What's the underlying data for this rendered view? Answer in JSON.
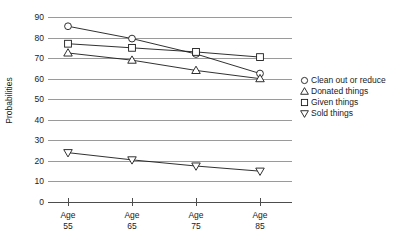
{
  "chart_data": {
    "type": "line",
    "title": "",
    "xlabel": "",
    "ylabel": "Probabilities",
    "categories": [
      "Age 55",
      "Age 65",
      "Age 75",
      "Age 85"
    ],
    "category_lines": [
      {
        "line1": "Age",
        "line2": "55"
      },
      {
        "line1": "Age",
        "line2": "65"
      },
      {
        "line1": "Age",
        "line2": "75"
      },
      {
        "line1": "Age",
        "line2": "85"
      }
    ],
    "ylim": [
      0,
      90
    ],
    "yticks": [
      0,
      10,
      20,
      30,
      40,
      50,
      60,
      70,
      80,
      90
    ],
    "ytick_labels": [
      "0",
      "10",
      "20",
      "30",
      "40",
      "50",
      "60",
      "70",
      "80",
      "90"
    ],
    "grid": true,
    "legend_position": "right",
    "series": [
      {
        "name": "Clean out or reduce",
        "marker": "circle",
        "values": [
          85.5,
          79.5,
          72.0,
          62.5
        ]
      },
      {
        "name": "Donated things",
        "marker": "triangle-up",
        "values": [
          72.5,
          69.0,
          64.0,
          60.0
        ]
      },
      {
        "name": "Given things",
        "marker": "square",
        "values": [
          77.0,
          75.0,
          73.0,
          70.5
        ]
      },
      {
        "name": "Sold things",
        "marker": "triangle-down",
        "values": [
          24.0,
          20.5,
          17.5,
          15.0
        ]
      }
    ],
    "colors": {
      "line": "#1a1a1a",
      "marker_fill": "#ffffff",
      "grid": "#9a9a9a",
      "axis": "#4d4d4d",
      "text": "#1a1a1a",
      "background": "#ffffff"
    }
  },
  "legend": {
    "items": [
      {
        "label": "Clean out or reduce",
        "marker": "circle"
      },
      {
        "label": "Donated things",
        "marker": "triangle-up"
      },
      {
        "label": "Given things",
        "marker": "square"
      },
      {
        "label": "Sold things",
        "marker": "triangle-down"
      }
    ]
  }
}
